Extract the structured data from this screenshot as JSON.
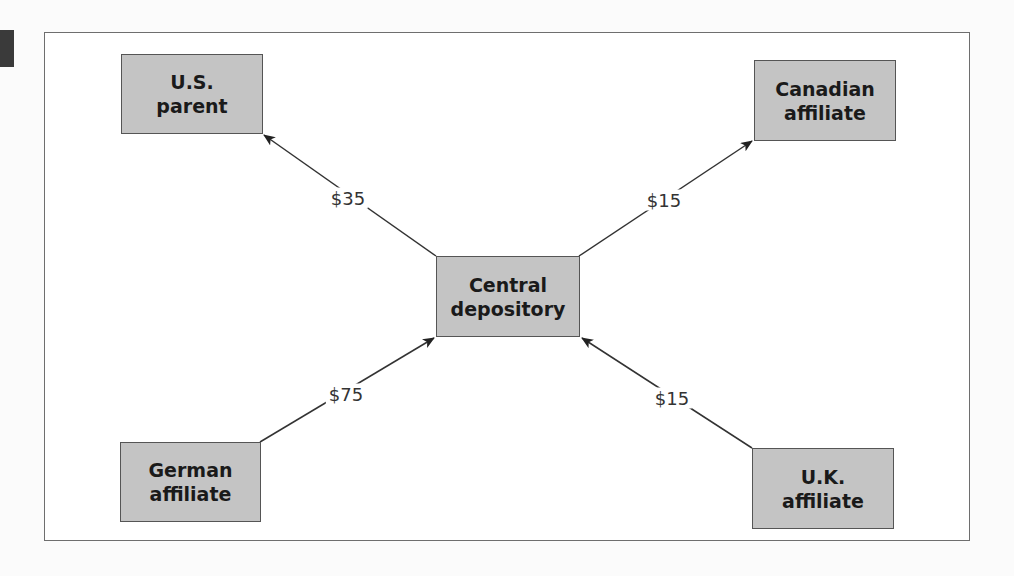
{
  "diagram": {
    "type": "flow-diagram",
    "nodes": [
      {
        "id": "us_parent",
        "line1": "U.S.",
        "line2": "parent"
      },
      {
        "id": "canadian_affiliate",
        "line1": "Canadian",
        "line2": "affiliate"
      },
      {
        "id": "central_depository",
        "line1": "Central",
        "line2": "depository"
      },
      {
        "id": "german_affiliate",
        "line1": "German",
        "line2": "affiliate"
      },
      {
        "id": "uk_affiliate",
        "line1": "U.K.",
        "line2": "affiliate"
      }
    ],
    "edges": [
      {
        "from": "central_depository",
        "to": "us_parent",
        "label": "$35"
      },
      {
        "from": "central_depository",
        "to": "canadian_affiliate",
        "label": "$15"
      },
      {
        "from": "german_affiliate",
        "to": "central_depository",
        "label": "$75"
      },
      {
        "from": "uk_affiliate",
        "to": "central_depository",
        "label": "$15"
      }
    ],
    "colors": {
      "node_fill": "#c4c4c4",
      "node_border": "#555555",
      "line": "#333333",
      "frame": "#6e6e6e"
    }
  }
}
